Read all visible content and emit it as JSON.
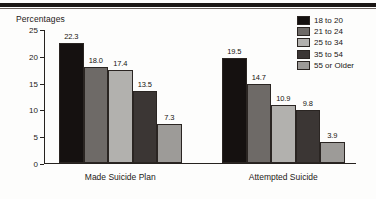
{
  "figure": {
    "y_axis_caption": "Percentages"
  },
  "chart_data": {
    "type": "bar",
    "title": "",
    "xlabel": "",
    "ylabel": "Percentages",
    "ylim": [
      0,
      25
    ],
    "yticks": [
      0,
      5,
      10,
      15,
      20,
      25
    ],
    "ytick_labels": [
      "0",
      "5",
      "10",
      "15",
      "20",
      "25"
    ],
    "grid": false,
    "legend_position": "top-right",
    "categories": [
      "Made Suicide Plan",
      "Attempted Suicide"
    ],
    "series": [
      {
        "name": "18 to 20",
        "color": "#151110",
        "values": [
          22.3,
          19.5
        ],
        "value_labels": [
          "22.3",
          "19.5"
        ]
      },
      {
        "name": "21 to 24",
        "color": "#6e6a67",
        "values": [
          18.0,
          14.7
        ],
        "value_labels": [
          "18.0",
          "14.7"
        ]
      },
      {
        "name": "25 to 34",
        "color": "#b2b1ae",
        "values": [
          17.4,
          10.9
        ],
        "value_labels": [
          "17.4",
          "10.9"
        ]
      },
      {
        "name": "35 to 54",
        "color": "#3b3634",
        "values": [
          13.5,
          9.8
        ],
        "value_labels": [
          "13.5",
          "9.8"
        ]
      },
      {
        "name": "55 or Older",
        "color": "#9d9b98",
        "values": [
          7.3,
          3.9
        ],
        "value_labels": [
          "7.3",
          "3.9"
        ]
      }
    ]
  }
}
